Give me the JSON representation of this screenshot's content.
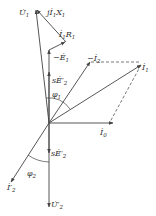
{
  "diagram": {
    "type": "phasor-diagram",
    "origin": [
      49,
      123
    ],
    "phasors": [
      {
        "name": "U1",
        "label": "U̇",
        "sub": "1",
        "from": [
          49,
          123
        ],
        "to": [
          36,
          9
        ]
      },
      {
        "name": "minus-E1",
        "label": "−Ė",
        "sub": "1",
        "from": [
          49,
          123
        ],
        "to": [
          49,
          50
        ]
      },
      {
        "name": "I1R1",
        "label": "İ",
        "sub": "1",
        "extra": "R",
        "extra_sub": "1",
        "from": [
          49,
          50
        ],
        "to": [
          66,
          42
        ]
      },
      {
        "name": "jI1X1",
        "label": "jİ",
        "sub": "1",
        "extra": "X",
        "extra_sub": "1",
        "from": [
          66,
          42
        ],
        "to": [
          36,
          9
        ]
      },
      {
        "name": "minus-I2",
        "label": "−İ",
        "sub": "2",
        "from": [
          49,
          123
        ],
        "to": [
          90,
          62
        ]
      },
      {
        "name": "I1",
        "label": "İ",
        "sub": "1",
        "from": [
          49,
          123
        ],
        "to": [
          141,
          65
        ]
      },
      {
        "name": "I0",
        "label": "İ",
        "sub": "0",
        "from": [
          49,
          123
        ],
        "to": [
          113,
          123
        ]
      },
      {
        "name": "sE2p-up",
        "label": "sĖ′",
        "sub": "2",
        "from": [
          49,
          123
        ],
        "to": [
          49,
          72
        ]
      },
      {
        "name": "sE2p-down",
        "label": "sĖ′",
        "sub": "2",
        "from": [
          49,
          123
        ],
        "to": [
          49,
          153
        ]
      },
      {
        "name": "U2p",
        "label": "U̇′",
        "sub": "2",
        "from": [
          49,
          123
        ],
        "to": [
          49,
          207
        ]
      },
      {
        "name": "I2p",
        "label": "İ′",
        "sub": "2",
        "from": [
          49,
          123
        ],
        "to": [
          11,
          182
        ]
      }
    ],
    "angles": [
      {
        "name": "phi1",
        "label": "φ",
        "sub": "1"
      },
      {
        "name": "phi2",
        "label": "φ",
        "sub": "2"
      }
    ],
    "labels": {
      "U1": "U̇",
      "U1_sub": "1",
      "jI1X1": "jİ",
      "jI1X1_sub": "1",
      "jI1X1_x": "X",
      "jI1X1_xsub": "1",
      "I1R1": "İ",
      "I1R1_sub": "1",
      "I1R1_r": "R",
      "I1R1_rsub": "1",
      "mE1": "−Ė",
      "mE1_sub": "1",
      "mI2": "−İ",
      "mI2_sub": "2",
      "I1": "İ",
      "I1_sub": "1",
      "sE2_up": "sĖ′",
      "sE2_up_sub": "2",
      "phi1": "φ",
      "phi1_sub": "1",
      "I0": "İ",
      "I0_sub": "0",
      "sE2_down": "sĖ′",
      "sE2_down_sub": "2",
      "phi2": "φ",
      "phi2_sub": "2",
      "I2p": "İ′",
      "I2p_sub": "2",
      "U2p": "U̇′",
      "U2p_sub": "2"
    },
    "colors": {
      "line": "#444444",
      "dash": "#555555",
      "text": "#333333"
    }
  }
}
